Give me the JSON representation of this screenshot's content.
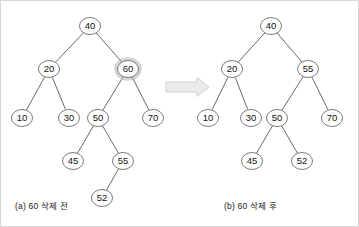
{
  "figure": {
    "title_left": "(a) 60 삭제 전",
    "title_right": "(b) 60 삭제 후",
    "arrow": "right-arrow-icon",
    "colors": {
      "node_stroke": "#6d6d6d",
      "node_fill": "#ffffff",
      "edge": "#5a5a5a",
      "text": "#111111",
      "highlight_halo": "#b0b0b0",
      "arrow_fill": "#ebebeb",
      "arrow_stroke": "#cfcfcf",
      "border": "#d8d8d8"
    }
  },
  "chart_data": {
    "type": "diagram",
    "panels": [
      {
        "id": "before",
        "label": "(a) 60 삭제 전",
        "root": 40,
        "nodes": [
          {
            "value": "40",
            "x": 89,
            "y": 25,
            "highlight": false
          },
          {
            "value": "20",
            "x": 48,
            "y": 68,
            "highlight": false
          },
          {
            "value": "60",
            "x": 127,
            "y": 68,
            "highlight": true
          },
          {
            "value": "10",
            "x": 21,
            "y": 117,
            "highlight": false
          },
          {
            "value": "30",
            "x": 68,
            "y": 117,
            "highlight": false
          },
          {
            "value": "50",
            "x": 97,
            "y": 117,
            "highlight": false
          },
          {
            "value": "70",
            "x": 152,
            "y": 117,
            "highlight": false
          },
          {
            "value": "45",
            "x": 72,
            "y": 160,
            "highlight": false
          },
          {
            "value": "55",
            "x": 122,
            "y": 160,
            "highlight": false
          },
          {
            "value": "52",
            "x": 101,
            "y": 197,
            "highlight": false
          }
        ],
        "edges": [
          {
            "from": "40",
            "to": "20"
          },
          {
            "from": "40",
            "to": "60"
          },
          {
            "from": "20",
            "to": "10"
          },
          {
            "from": "20",
            "to": "30"
          },
          {
            "from": "60",
            "to": "50"
          },
          {
            "from": "60",
            "to": "70"
          },
          {
            "from": "50",
            "to": "45"
          },
          {
            "from": "50",
            "to": "55"
          },
          {
            "from": "55",
            "to": "52"
          }
        ]
      },
      {
        "id": "after",
        "label": "(b) 60 삭제 후",
        "root": 40,
        "nodes": [
          {
            "value": "40",
            "x": 270,
            "y": 25,
            "highlight": false
          },
          {
            "value": "20",
            "x": 231,
            "y": 68,
            "highlight": false
          },
          {
            "value": "55",
            "x": 307,
            "y": 68,
            "highlight": false
          },
          {
            "value": "10",
            "x": 207,
            "y": 117,
            "highlight": false
          },
          {
            "value": "30",
            "x": 250,
            "y": 117,
            "highlight": false
          },
          {
            "value": "50",
            "x": 276,
            "y": 117,
            "highlight": false
          },
          {
            "value": "70",
            "x": 331,
            "y": 117,
            "highlight": false
          },
          {
            "value": "45",
            "x": 251,
            "y": 160,
            "highlight": false
          },
          {
            "value": "52",
            "x": 301,
            "y": 160,
            "highlight": false
          }
        ],
        "edges": [
          {
            "from": "40",
            "to": "20"
          },
          {
            "from": "40",
            "to": "55"
          },
          {
            "from": "20",
            "to": "10"
          },
          {
            "from": "20",
            "to": "30"
          },
          {
            "from": "55",
            "to": "50"
          },
          {
            "from": "55",
            "to": "70"
          },
          {
            "from": "50",
            "to": "45"
          },
          {
            "from": "50",
            "to": "52"
          }
        ]
      }
    ],
    "arrow": {
      "x1": 165,
      "y1": 86,
      "x2": 208,
      "y2": 86
    },
    "node_rx": 10.5,
    "node_ry": 8.5
  }
}
